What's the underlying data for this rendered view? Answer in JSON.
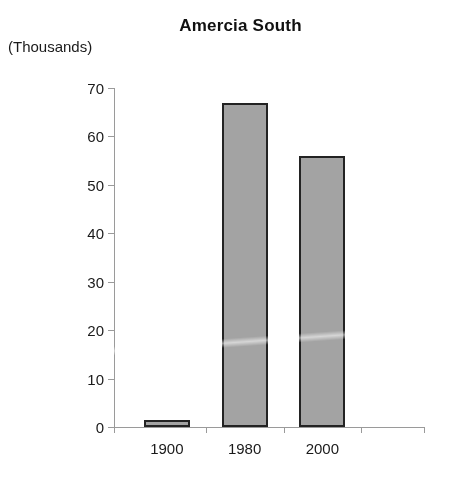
{
  "chart_data": {
    "type": "bar",
    "title": "Amercia South",
    "subtitle": "",
    "units_label": "(Thousands)",
    "categories": [
      "1900",
      "1980",
      "2000"
    ],
    "values": [
      1.5,
      67,
      56
    ],
    "series": [
      {
        "name": "Amercia South",
        "values": [
          1.5,
          67,
          56
        ]
      }
    ],
    "xlabel": "",
    "ylabel": "(Thousands)",
    "ylim": [
      0,
      70
    ],
    "ytick_values": [
      0,
      10,
      20,
      30,
      40,
      50,
      60,
      70
    ],
    "ytick_labels": [
      "0",
      "10",
      "20",
      "30",
      "40",
      "50",
      "60",
      "70"
    ],
    "grid": false,
    "legend": false,
    "legend_position": "none",
    "colors": {
      "bar_fill": "#a3a3a3",
      "bar_border": "#232323",
      "axis": "#9a9a9a",
      "text": "#1a1a1a",
      "background": "#ffffff"
    }
  }
}
